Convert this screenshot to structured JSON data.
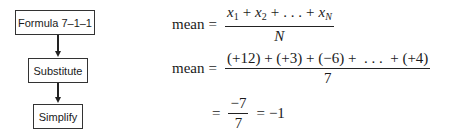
{
  "flowchart": {
    "steps": [
      {
        "label": "Formula 7–1–1"
      },
      {
        "label": "Substitute"
      },
      {
        "label": "Simplify"
      }
    ]
  },
  "equations": {
    "line1": {
      "lhs": "mean",
      "eq": "=",
      "numerator": {
        "x1": "x",
        "s1": "1",
        "plus1": "+",
        "x2": "x",
        "s2": "2",
        "plus2": "+",
        "dots": ". . .",
        "plus3": "+",
        "xn": "x",
        "sn": "N"
      },
      "denominator": "N"
    },
    "line2": {
      "lhs": "mean",
      "eq": "=",
      "numerator": "(+12) + (+3) + (−6) +  . . .  + (+4)",
      "denominator": "7"
    },
    "line3": {
      "eq": "=",
      "numerator": "−7",
      "denominator": "7",
      "eq2": "=",
      "result": "−1"
    }
  }
}
